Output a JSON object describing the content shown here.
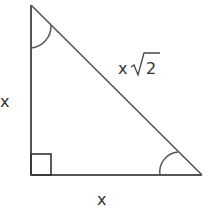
{
  "diagram": {
    "type": "right-isosceles-triangle",
    "labels": {
      "left_leg": "x",
      "bottom_leg": "x",
      "hypotenuse_var": "x",
      "hypotenuse_radicand": "2"
    },
    "colors": {
      "stroke": "#555555",
      "text": "#333333",
      "background": "#ffffff"
    }
  }
}
